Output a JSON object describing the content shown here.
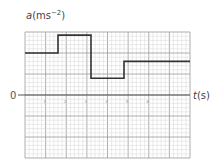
{
  "chart_data": {
    "type": "line",
    "style": "step",
    "title": "",
    "ylabel": "a(ms⁻²)",
    "ylabel_var": "a",
    "ylabel_unit": "(ms",
    "ylabel_exp": "−2",
    "ylabel_close": ")",
    "xlabel": "t(s)",
    "xlabel_var": "t",
    "xlabel_unit": "(s)",
    "origin_label": "0",
    "xlim": [
      0,
      8
    ],
    "ylim": [
      -3,
      3
    ],
    "grid": true,
    "x_ticks": [
      "1",
      "2",
      "3",
      "4",
      "5",
      "6"
    ],
    "series": [
      {
        "name": "acceleration",
        "points": [
          {
            "t": 0,
            "a": 2.0
          },
          {
            "t": 1.6,
            "a": 2.0
          },
          {
            "t": 1.6,
            "a": 2.85
          },
          {
            "t": 3.2,
            "a": 2.85
          },
          {
            "t": 3.2,
            "a": 0.8
          },
          {
            "t": 4.8,
            "a": 0.8
          },
          {
            "t": 4.8,
            "a": 1.6
          },
          {
            "t": 8,
            "a": 1.6
          }
        ],
        "color": "#333333"
      }
    ]
  }
}
